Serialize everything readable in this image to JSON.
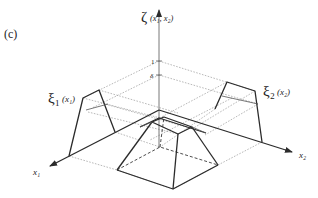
{
  "figure": {
    "panel_label": "(c)",
    "vertical_axis": {
      "symbol": "ζ",
      "args": "(x₁, x₂)",
      "ticks": [
        "1",
        "δ"
      ]
    },
    "x1_axis": {
      "label": "x₁"
    },
    "x2_axis": {
      "label": "x₂"
    },
    "membership_1": {
      "symbol": "ξ₁",
      "args": "(x₁)"
    },
    "membership_2": {
      "symbol": "ξ₂",
      "args": "(x₂)"
    },
    "colors": {
      "line": "#2b2b2b",
      "guide": "#8a8a8a",
      "background": "#ffffff"
    }
  }
}
